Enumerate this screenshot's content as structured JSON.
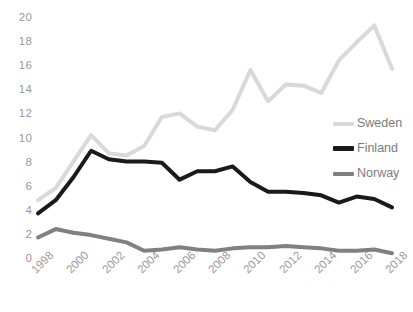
{
  "chart_data": {
    "type": "line",
    "title": "",
    "xlabel": "",
    "ylabel": "",
    "x": [
      1998,
      1999,
      2000,
      2001,
      2002,
      2003,
      2004,
      2005,
      2006,
      2007,
      2008,
      2009,
      2010,
      2011,
      2012,
      2013,
      2014,
      2015,
      2016,
      2017,
      2018
    ],
    "xlim": [
      1998,
      2018
    ],
    "ylim": [
      0,
      20
    ],
    "ytick_step": 2,
    "xtick_step": 2,
    "xtick_labels": [
      "1998",
      "2000",
      "2002",
      "2004",
      "2006",
      "2008",
      "2010",
      "2012",
      "2014",
      "2016",
      "2018"
    ],
    "ytick_labels": [
      "0",
      "2",
      "4",
      "6",
      "8",
      "10",
      "12",
      "14",
      "16",
      "18",
      "20"
    ],
    "grid": false,
    "legend_position": "right-middle",
    "series": [
      {
        "name": "Sweden",
        "color": "#d9d9d9",
        "width": 4,
        "values": [
          4.8,
          5.8,
          8.0,
          10.2,
          8.7,
          8.5,
          9.3,
          11.7,
          12.0,
          10.9,
          10.6,
          12.3,
          15.6,
          13.0,
          14.4,
          14.3,
          13.7,
          16.4,
          17.9,
          19.3,
          15.7
        ]
      },
      {
        "name": "Finland",
        "color": "#1a1a1a",
        "width": 4,
        "values": [
          3.7,
          4.8,
          6.7,
          8.9,
          8.2,
          8.0,
          8.0,
          7.9,
          6.5,
          7.2,
          7.2,
          7.6,
          6.3,
          5.5,
          5.5,
          5.4,
          5.2,
          4.6,
          5.1,
          4.9,
          4.2
        ]
      },
      {
        "name": "Norway",
        "color": "#808080",
        "width": 4,
        "values": [
          1.7,
          2.4,
          2.1,
          1.9,
          1.6,
          1.3,
          0.6,
          0.7,
          0.9,
          0.7,
          0.6,
          0.8,
          0.9,
          0.9,
          1.0,
          0.9,
          0.8,
          0.6,
          0.6,
          0.7,
          0.4
        ]
      }
    ]
  },
  "legend": {
    "items": [
      {
        "label": "Sweden"
      },
      {
        "label": "Finland"
      },
      {
        "label": "Norway"
      }
    ]
  }
}
